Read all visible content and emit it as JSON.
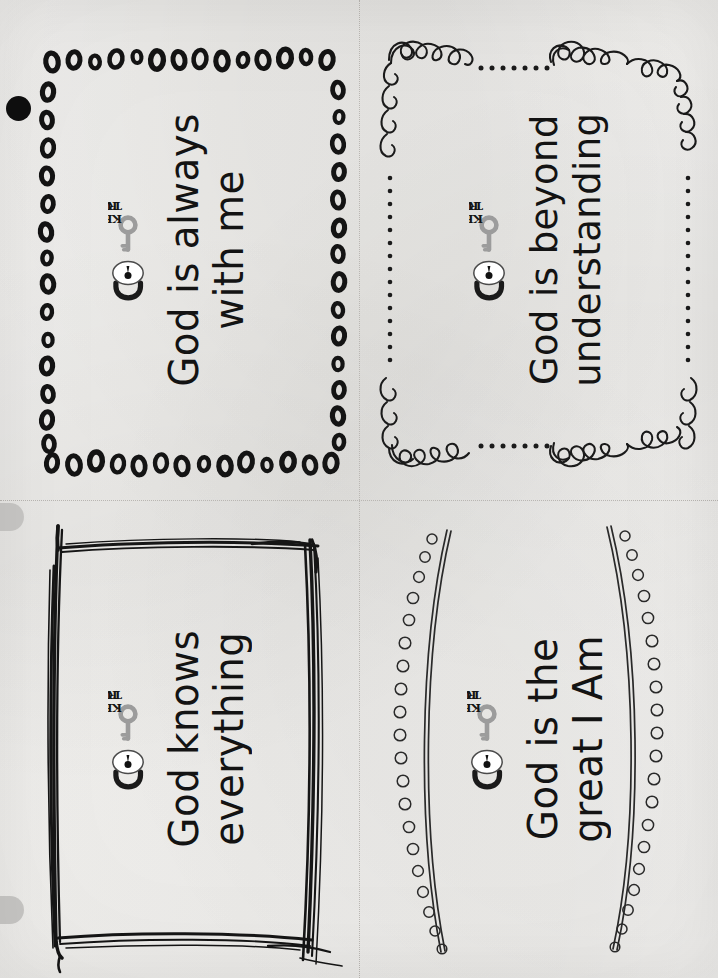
{
  "page": {
    "width": 718,
    "height": 978,
    "background_color": "#f4f3f1",
    "ink_color": "#131313",
    "key_color": "#9c9c9c",
    "cut_line_color": "#b9b6b2",
    "scan_artifact_color": "#c9c8c6"
  },
  "logo": {
    "line1": "KEY",
    "line2": "TRUTH:",
    "icons": {
      "padlock": "padlock-icon",
      "key": "key-icon"
    }
  },
  "cut_guides": {
    "vertical": "vertical-dotted-cut-line",
    "horizontal": "horizontal-dotted-cut-line"
  },
  "artifacts": {
    "black_dot": "scanner-black-dot",
    "tab_top": "scanner-edge-tab",
    "tab_bottom": "scanner-edge-tab"
  },
  "cards": [
    {
      "id": "card-top-left",
      "position": "top-left",
      "label": "KEY TRUTH:",
      "text": "God is always\nwith me",
      "border_style": "dotted-ovals",
      "border_name": "oval-bead-border"
    },
    {
      "id": "card-top-right",
      "position": "top-right",
      "label": "KEY TRUTH:",
      "text": "God is beyond\nunderstanding",
      "border_style": "curly-swirl",
      "border_name": "curly-swirl-border"
    },
    {
      "id": "card-bottom-left",
      "position": "bottom-left",
      "label": "KEY TRUTH:",
      "text": "God knows\neverything",
      "border_style": "sketchy-scribble",
      "border_name": "sketchy-rectangle-border"
    },
    {
      "id": "card-bottom-right",
      "position": "bottom-right",
      "label": "KEY TRUTH:",
      "text": "God is the\ngreat I Am",
      "border_style": "curved-bead-arcs",
      "border_name": "curved-bead-arc-border"
    }
  ]
}
